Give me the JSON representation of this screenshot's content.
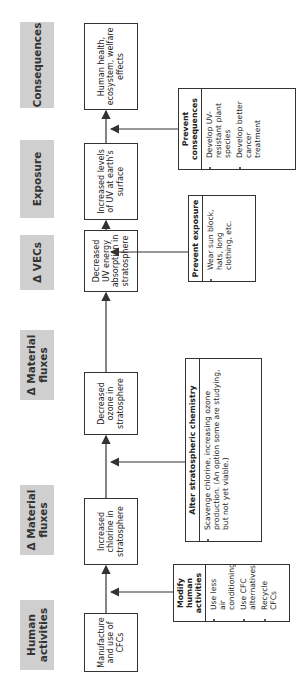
{
  "headers": [
    {
      "label": "Human activities"
    },
    {
      "label": "Δ Material fluxes"
    },
    {
      "label": "Δ Material fluxes"
    },
    {
      "label": "Δ VECs"
    },
    {
      "label": "Exposure"
    },
    {
      "label": "Consequences"
    }
  ],
  "chain": [
    {
      "label": "Manufacture and use of CFCs"
    },
    {
      "label": "Increased chlorine in stratosphere"
    },
    {
      "label": "Decreased ozone in stratosphere"
    },
    {
      "label": "Decreased UV energy absorption in stratosphere"
    },
    {
      "label": "Increased levels of UV at earth's surface"
    },
    {
      "label": "Human health, ecosystem, welfare effects"
    }
  ],
  "interventions": [
    {
      "title": "Modify human activities",
      "items": [
        "Use less air conditioning",
        "Use CFC alternatives",
        "Recycle CFCs"
      ]
    },
    {
      "title": "Alter stratospheric chemistry",
      "items": [
        "Scavenge chlorine, increasing ozone production. (An option some are studying, but not yet viable.)"
      ]
    },
    {
      "title": "Prevent exposure",
      "items": [
        "Wear sun block, hats, long clothing, etc."
      ]
    },
    {
      "title": "Prevent consequences",
      "items": [
        "Develop UV-resistant plant species",
        "Develop better cancer treatment"
      ]
    }
  ]
}
